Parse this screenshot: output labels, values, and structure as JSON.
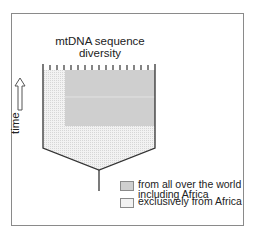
{
  "title": "mtDNA sequence diversity",
  "title_lines": [
    "mtDNA sequence",
    "diversity"
  ],
  "axis": {
    "label": "time",
    "arrow_direction": "up"
  },
  "legend": [
    {
      "label_lines": [
        "from all over the world",
        "including Africa"
      ],
      "color": "#cfcfcf",
      "pattern": "dense-gray"
    },
    {
      "label_lines": [
        "exclusively from Africa"
      ],
      "color": "#ececec",
      "pattern": "light-dots"
    }
  ],
  "colors": {
    "frame": "#8a8a8a",
    "outline": "#333333",
    "world_fill": "#cfcfcf",
    "africa_fill": "#ececec"
  },
  "diagram": {
    "tick_count": 15,
    "shape": "funnel tree: wide top with tick marks, converging to single stem"
  }
}
